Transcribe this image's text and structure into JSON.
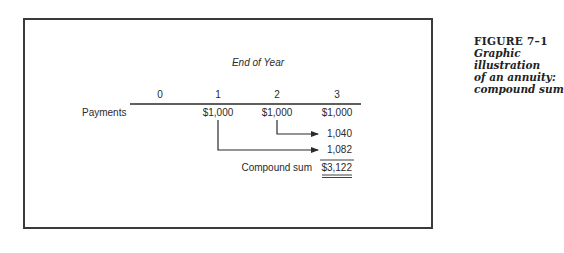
{
  "figure": {
    "label": "FIGURE 7–1",
    "caption_lines": [
      "Graphic illustration",
      "of an annuity:",
      "compound sum"
    ]
  },
  "diagram": {
    "axis_title": "End of Year",
    "years": [
      "0",
      "1",
      "2",
      "3"
    ],
    "row_label": "Payments",
    "payments": [
      "",
      "$1,000",
      "$1,000",
      "$1,000"
    ],
    "compounded_values": [
      "1,040",
      "1,082"
    ],
    "total_label": "Compound sum",
    "total_value": "$3,122"
  }
}
